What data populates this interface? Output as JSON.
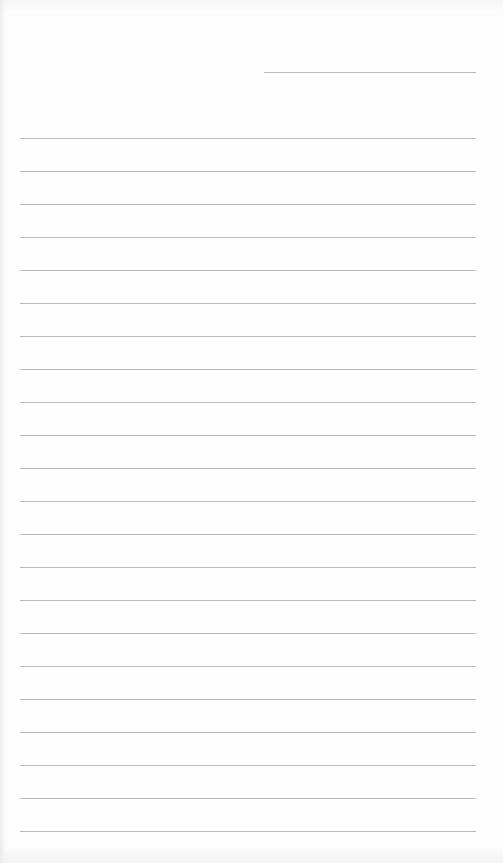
{
  "sheet": {
    "type": "lined-paper",
    "background_color": "#fdfdfd",
    "line_color": "#b9b9b9",
    "header_line": {
      "x1": 264,
      "x2": 476,
      "y": 72
    },
    "ruled_lines": {
      "x1": 20,
      "x2": 476,
      "first_y": 138,
      "spacing": 33,
      "count": 22
    }
  }
}
